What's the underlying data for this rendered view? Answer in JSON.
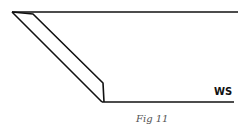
{
  "diagram": {
    "label": "WS",
    "caption": "Fig 11",
    "stroke_color": "#111111",
    "caption_color": "#555555"
  }
}
